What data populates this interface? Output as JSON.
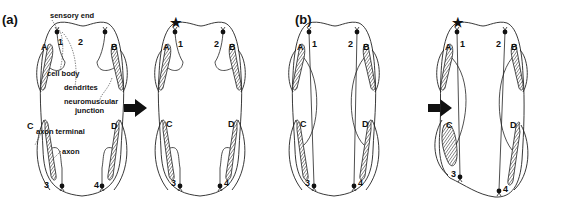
{
  "panels": [
    {
      "id": "a",
      "label": "(a)"
    },
    {
      "id": "b",
      "label": "(b)"
    }
  ],
  "annotations": {
    "sensory_end": "sensory end",
    "cell_body": "cell body",
    "dendrites": "dendrites",
    "neuromuscular_junction_1": "neuromuscular",
    "neuromuscular_junction_2": "junction",
    "axon_terminal": "axon terminal",
    "axon": "axon"
  },
  "muscle_labels": {
    "A": "A",
    "B": "B",
    "C": "C",
    "D": "D"
  },
  "neuron_labels": {
    "n1": "1",
    "n2": "2",
    "n3": "3",
    "n4": "4"
  },
  "stimulus_marker": "★",
  "colors": {
    "line": "#222222",
    "fill": "#111111",
    "background": "#ffffff"
  }
}
